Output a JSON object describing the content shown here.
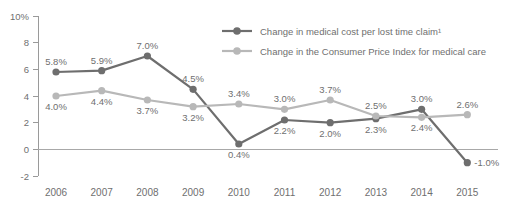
{
  "chart_data": {
    "type": "line",
    "title": "",
    "xlabel": "",
    "ylabel": "",
    "categories": [
      "2006",
      "2007",
      "2008",
      "2009",
      "2010",
      "2011",
      "2012",
      "2013",
      "2014",
      "2015"
    ],
    "ylim": [
      -2,
      10
    ],
    "yticks": [
      10,
      8,
      6,
      4,
      2,
      0,
      -2
    ],
    "ytick_labels": [
      "10%",
      "8",
      "6",
      "4",
      "2",
      "0",
      "-2"
    ],
    "grid": false,
    "zero_line": true,
    "legend_position": "top-right",
    "series": [
      {
        "name": "Change in medical cost per lost time claim¹",
        "color": "#6e6e6e",
        "values": [
          5.8,
          5.9,
          7.0,
          4.5,
          0.4,
          2.2,
          2.0,
          2.3,
          3.0,
          -1.0
        ],
        "labels": [
          "5.8%",
          "5.9%",
          "7.0%",
          "4.5%",
          "0.4%",
          "2.2%",
          "2.0%",
          "2.3%",
          "3.0%",
          "-1.0%"
        ],
        "label_positions": [
          "above",
          "above",
          "above",
          "above",
          "below",
          "below",
          "below",
          "below",
          "above",
          "right"
        ]
      },
      {
        "name": "Change in the Consumer Price Index for medical care",
        "color": "#b8b8b8",
        "values": [
          4.0,
          4.4,
          3.7,
          3.2,
          3.4,
          3.0,
          3.7,
          2.5,
          2.4,
          2.6
        ],
        "labels": [
          "4.0%",
          "4.4%",
          "3.7%",
          "3.2%",
          "3.4%",
          "3.0%",
          "3.7%",
          "2.5%",
          "2.4%",
          "2.6%"
        ],
        "label_positions": [
          "below",
          "below",
          "below",
          "below",
          "above",
          "above",
          "above",
          "above",
          "below",
          "above"
        ]
      }
    ]
  },
  "legend": {
    "entries": [
      {
        "label": "Change in medical cost per lost time claim¹",
        "color": "#6e6e6e"
      },
      {
        "label": "Change in the Consumer Price Index for medical care",
        "color": "#b8b8b8"
      }
    ]
  },
  "colors": {
    "series_dark": "#6e6e6e",
    "series_light": "#b8b8b8",
    "axis": "#9a9a9a",
    "text": "#6f6f6f",
    "background": "#ffffff"
  }
}
